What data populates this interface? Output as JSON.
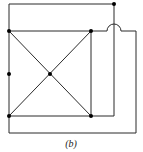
{
  "figure": {
    "caption": "(b)",
    "colors": {
      "line": "#2a2a2a",
      "node": "#000000",
      "background": "#ffffff"
    },
    "vertices": [
      {
        "id": "top-left"
      },
      {
        "id": "top-right"
      },
      {
        "id": "bottom-left"
      },
      {
        "id": "bottom-right"
      },
      {
        "id": "center"
      },
      {
        "id": "left-middle"
      },
      {
        "id": "outer-top-right"
      }
    ],
    "crossover_count": 1
  }
}
